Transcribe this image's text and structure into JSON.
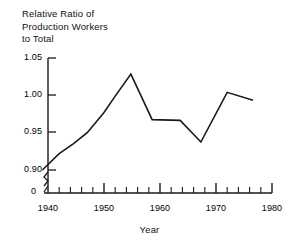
{
  "chart_data": {
    "type": "line",
    "title": "Relative Ratio of\nProduction Workers\nto Total",
    "title_lines": [
      "Relative Ratio of",
      "Production Workers",
      "to Total"
    ],
    "xlabel": "Year",
    "ylabel": "",
    "xlim": [
      1938,
      1980
    ],
    "ylim": [
      0.885,
      1.05
    ],
    "y_axis_broken": true,
    "y_break_label": "0",
    "grid": false,
    "legend": null,
    "xticks": [
      1940,
      1950,
      1960,
      1970,
      1980
    ],
    "xtick_labels": [
      "1940",
      "1950",
      "1960",
      "1970",
      "1980"
    ],
    "x_minor_tick_interval": 2,
    "yticks": [
      0.9,
      0.95,
      1.0,
      1.05
    ],
    "ytick_labels": [
      "0.90",
      "0.95",
      "1.00",
      "1.05"
    ],
    "line_color": "#1a1a1a",
    "line_width": 1.6,
    "x": [
      1939.0,
      1942.0,
      1944.5,
      1947.0,
      1950.0,
      1952.0,
      1954.8,
      1958.6,
      1963.6,
      1967.3,
      1972.0,
      1976.6
    ],
    "values": [
      0.9,
      0.922,
      0.935,
      0.95,
      0.977,
      0.999,
      1.0285,
      0.9675,
      0.9665,
      0.9375,
      1.004,
      0.9935
    ],
    "points": [
      {
        "year": 1939.0,
        "value": 0.9
      },
      {
        "year": 1942.0,
        "value": 0.922
      },
      {
        "year": 1944.5,
        "value": 0.935
      },
      {
        "year": 1947.0,
        "value": 0.95
      },
      {
        "year": 1950.0,
        "value": 0.977
      },
      {
        "year": 1952.0,
        "value": 0.999
      },
      {
        "year": 1954.8,
        "value": 1.0285
      },
      {
        "year": 1958.6,
        "value": 0.9675
      },
      {
        "year": 1963.6,
        "value": 0.9665
      },
      {
        "year": 1967.3,
        "value": 0.9375
      },
      {
        "year": 1972.0,
        "value": 1.004
      },
      {
        "year": 1976.6,
        "value": 0.9935
      }
    ]
  },
  "axes": {
    "y": {
      "labels": [
        {
          "text": "1.05"
        },
        {
          "text": "1.00"
        },
        {
          "text": "0.95"
        },
        {
          "text": "0.90"
        },
        {
          "text": "0"
        }
      ]
    },
    "x": {
      "labels": [
        {
          "text": "1940"
        },
        {
          "text": "1950"
        },
        {
          "text": "1960"
        },
        {
          "text": "1970"
        },
        {
          "text": "1980"
        }
      ]
    }
  }
}
